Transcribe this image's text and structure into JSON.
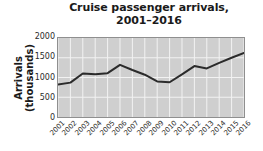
{
  "chart_data": {
    "type": "line",
    "title": "Cruise passenger arrivals, 2001–2016",
    "title_line1": "Cruise passenger arrivals,",
    "title_line2": "2001–2016",
    "xlabel": "",
    "ylabel": "Arrivals (thousands)",
    "ylabel_line1": "Arrivals",
    "ylabel_line2": "(thousands)",
    "categories": [
      "2001",
      "2002",
      "2003",
      "2004",
      "2005",
      "2006",
      "2007",
      "2008",
      "2009",
      "2010",
      "2011",
      "2012",
      "2013",
      "2014",
      "2015",
      "2016"
    ],
    "values": [
      820,
      870,
      1100,
      1080,
      1110,
      1320,
      1190,
      1070,
      900,
      880,
      1080,
      1290,
      1230,
      1370,
      1500,
      1620
    ],
    "yticks": [
      "2000",
      "1500",
      "1000",
      "500",
      "0"
    ],
    "ytick_values": [
      2000,
      1500,
      1000,
      500,
      0
    ],
    "ylim": [
      0,
      2000
    ],
    "grid": true,
    "legend": "none",
    "series_name": "Arrivals",
    "colors": {
      "line": "#2b2b2b",
      "plot_background": "#cfcfcf",
      "gridline": "#f2f2f2",
      "axis": "#8f8f8f",
      "text": "#1a1a1a",
      "page_background": "#ffffff"
    }
  }
}
